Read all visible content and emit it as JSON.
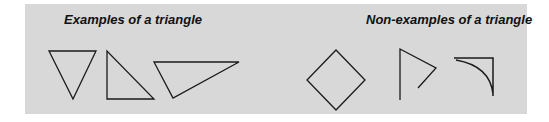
{
  "diagram": {
    "background_color": "#d8d8d8",
    "stroke_color": "#1a1a1a",
    "sections": [
      {
        "heading": "Examples of a triangle",
        "shapes": [
          {
            "name": "inverted-triangle",
            "kind": "polygon"
          },
          {
            "name": "right-triangle",
            "kind": "polygon"
          },
          {
            "name": "obtuse-triangle",
            "kind": "polygon"
          }
        ]
      },
      {
        "heading": "Non-examples of a triangle",
        "shapes": [
          {
            "name": "diamond-square",
            "kind": "polygon"
          },
          {
            "name": "open-angle-figure",
            "kind": "polyline"
          },
          {
            "name": "curved-side-figure",
            "kind": "path"
          }
        ]
      }
    ]
  }
}
